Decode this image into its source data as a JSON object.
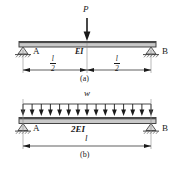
{
  "figure": {
    "colors": {
      "line": "#1a1a1a",
      "beam_fill": "#c9c9c9",
      "beam_edge": "#333333",
      "hatch": "#555555",
      "background": "#ffffff"
    }
  },
  "diagram_a": {
    "caption": "(a)",
    "load_label": "P",
    "load_type": "point-load",
    "stiffness_label": "EI",
    "support_left_label": "A",
    "support_right_label": "B",
    "support_left_type": "pin",
    "support_right_type": "roller",
    "dimension_left": {
      "numerator": "l",
      "denominator": "2"
    },
    "dimension_right": {
      "numerator": "l",
      "denominator": "2"
    },
    "span_segments": 2
  },
  "diagram_b": {
    "caption": "(b)",
    "load_label": "w",
    "load_type": "uniform-distributed-load",
    "arrow_count": 15,
    "stiffness_label": "2EI",
    "support_left_label": "A",
    "support_right_label": "B",
    "support_left_type": "pin",
    "support_right_type": "roller",
    "dimension_total": "l",
    "span_segments": 1
  }
}
